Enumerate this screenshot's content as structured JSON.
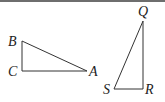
{
  "figure": {
    "triangle_left": {
      "vertices": {
        "B": {
          "label": "B",
          "x": 22,
          "y": 41
        },
        "C": {
          "label": "C",
          "x": 22,
          "y": 71
        },
        "A": {
          "label": "A",
          "x": 87,
          "y": 71
        }
      },
      "right_angle_at": "C"
    },
    "triangle_right": {
      "vertices": {
        "Q": {
          "label": "Q",
          "x": 143,
          "y": 21
        },
        "R": {
          "label": "R",
          "x": 143,
          "y": 89
        },
        "S": {
          "label": "S",
          "x": 114,
          "y": 89
        }
      },
      "right_angle_at": "R"
    },
    "colors": {
      "stroke": "#333333",
      "top_rule": "#6e6e6e",
      "background": "#ffffff"
    }
  }
}
